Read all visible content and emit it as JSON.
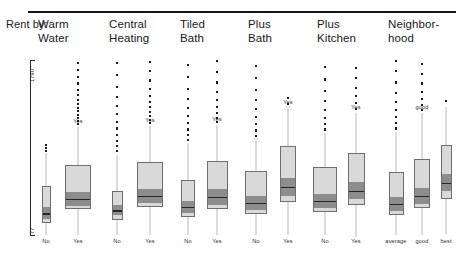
{
  "header": {
    "row_label": "Rent by:",
    "groups": [
      "Warm\nWater",
      "Central\nHeating",
      "Tiled\nBath",
      "Plus\nBath",
      "Plus\nKitchen",
      "Neighbor-\nhood"
    ]
  },
  "axis": {
    "top_tick": "1790",
    "bottom_tick": "77"
  },
  "colors": {
    "box_light": "#d9d9d9",
    "box_band": "#8d8d8d",
    "box_border": "#6e6e6e",
    "median": "#262626",
    "whisker": "#b9b9b9",
    "outlier": "#1b1b1b",
    "rule": "#151515"
  },
  "chart_data": {
    "type": "box",
    "xlabel": "",
    "ylabel": "Rent",
    "ylim": [
      77,
      1790
    ],
    "grid": false,
    "legend": "none",
    "note": "Variable-width boxplots; box width encodes group size. Values in DM rent units read off the 77-1790 axis.",
    "groups": [
      {
        "name": "Warm Water",
        "boxes": [
          {
            "label": "No",
            "width_rel": 0.3,
            "lower_whisker": 77,
            "q1": 190,
            "median": 300,
            "q3": 560,
            "upper_whisker": 880,
            "outliers": [
              900,
              930,
              960
            ]
          },
          {
            "label": "Yes",
            "width_rel": 1.0,
            "lower_whisker": 77,
            "q1": 330,
            "median": 440,
            "q3": 760,
            "upper_whisker": 1130,
            "outliers": [
              1160,
              1190,
              1220,
              1250,
              1290,
              1320,
              1360,
              1400,
              1450,
              1500,
              1560,
              1620,
              1690,
              1760
            ]
          }
        ]
      },
      {
        "name": "Central Heating",
        "boxes": [
          {
            "label": "No",
            "width_rel": 0.42,
            "lower_whisker": 77,
            "q1": 220,
            "median": 330,
            "q3": 510,
            "upper_whisker": 860,
            "outliers": [
              900,
              950,
              1000,
              1060,
              1120,
              1180,
              1260,
              1340,
              1430,
              1530,
              1640,
              1760
            ]
          },
          {
            "label": "Yes",
            "width_rel": 1.0,
            "lower_whisker": 77,
            "q1": 350,
            "median": 470,
            "q3": 790,
            "upper_whisker": 1140,
            "outliers": [
              1170,
              1200,
              1240,
              1280,
              1330,
              1380,
              1440,
              1510,
              1590,
              1680,
              1770
            ]
          }
        ]
      },
      {
        "name": "Tiled Bath",
        "boxes": [
          {
            "label": "No",
            "width_rel": 0.52,
            "lower_whisker": 77,
            "q1": 250,
            "median": 360,
            "q3": 620,
            "upper_whisker": 980,
            "outliers": [
              1010,
              1060,
              1110,
              1170,
              1240,
              1320,
              1410,
              1510,
              1620,
              1740
            ]
          },
          {
            "label": "Yes",
            "width_rel": 0.82,
            "lower_whisker": 77,
            "q1": 330,
            "median": 460,
            "q3": 800,
            "upper_whisker": 1150,
            "outliers": [
              1180,
              1220,
              1270,
              1330,
              1400,
              1480,
              1570,
              1670,
              1780
            ]
          }
        ]
      },
      {
        "name": "Plus Bath",
        "boxes": [
          {
            "label": "No",
            "width_rel": 0.84,
            "lower_whisker": 77,
            "q1": 280,
            "median": 400,
            "q3": 700,
            "upper_whisker": 1010,
            "outliers": [
              1050,
              1100,
              1160,
              1230,
              1310,
              1400,
              1500,
              1610,
              1730
            ]
          },
          {
            "label": "Yes",
            "width_rel": 0.62,
            "lower_whisker": 77,
            "q1": 400,
            "median": 560,
            "q3": 950,
            "upper_whisker": 1320,
            "outliers": [
              1360,
              1420
            ]
          }
        ]
      },
      {
        "name": "Plus Kitchen",
        "boxes": [
          {
            "label": "No",
            "width_rel": 0.92,
            "lower_whisker": 77,
            "q1": 300,
            "median": 420,
            "q3": 740,
            "upper_whisker": 1080,
            "outliers": [
              1110,
              1160,
              1220,
              1300,
              1390,
              1490,
              1600,
              1720
            ]
          },
          {
            "label": "Yes",
            "width_rel": 0.66,
            "lower_whisker": 60,
            "q1": 370,
            "median": 520,
            "q3": 880,
            "upper_whisker": 1270,
            "outliers": [
              1310,
              1370,
              1440,
              1520,
              1610,
              1710
            ]
          }
        ]
      },
      {
        "name": "Neighborhood",
        "boxes": [
          {
            "label": "average",
            "width_rel": 0.56,
            "lower_whisker": 77,
            "q1": 270,
            "median": 390,
            "q3": 690,
            "upper_whisker": 1090,
            "outliers": [
              1120,
              1170,
              1230,
              1300,
              1380,
              1470,
              1570,
              1680,
              1780
            ]
          },
          {
            "label": "good",
            "width_rel": 0.6,
            "lower_whisker": 77,
            "q1": 340,
            "median": 470,
            "q3": 820,
            "upper_whisker": 1270,
            "outliers": [
              1300,
              1350,
              1410,
              1480,
              1560,
              1650,
              1750
            ]
          },
          {
            "label": "best",
            "width_rel": 0.44,
            "lower_whisker": 90,
            "q1": 430,
            "median": 600,
            "q3": 960,
            "upper_whisker": 1330,
            "outliers": [
              1390
            ]
          }
        ]
      }
    ]
  }
}
